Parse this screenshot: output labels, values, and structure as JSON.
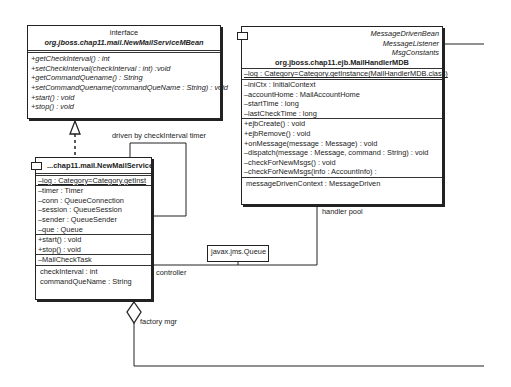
{
  "interface_box": {
    "stereotype": "interface",
    "name": "org.jboss.chap11.mail.NewMailServiceMBean",
    "operations": [
      "+getCheckInterval() : int",
      "+setCheckInterval(checkInterval : int) :void",
      "+getCommandQuename() : String",
      "+setCommandQuename(commandQueName : String) : void",
      "+start() : void",
      "+stop() : void"
    ]
  },
  "mdb_box": {
    "interfaces": [
      "MessageDrivenBean",
      "MessageListener",
      "MsgConstants"
    ],
    "name": "org.jboss.chap11.ejb.MailHandlerMDB",
    "static_attribute": "–log : Category=Category.getInstance(MailHandlerMDB.class)",
    "attributes": [
      "–iniCtx : InitialContext",
      "–accountHome : MailAccountHome",
      "–startTime : long",
      "–lastCheckTime : long"
    ],
    "operations": [
      "+ejbCreate() : void",
      "+ejbRemove() : void",
      "+onMessage(message : Message) : void",
      "–dispatch(message : Message, command : String) : void",
      "–checkForNewMsgs() : void",
      "–checkForNewMsgs(info : AccountInfo) :"
    ],
    "properties": [
      "messageDrivenContext : MessageDriven"
    ]
  },
  "service_box": {
    "name": "...chap11.mail.NewMailService",
    "static_attribute": "–log : Category=Category.getInst",
    "attributes": [
      "–timer : Timer",
      "–conn : QueueConnection",
      "–session : QueueSession",
      "–sender : QueueSender",
      "–que : Queue"
    ],
    "operations": [
      "+start() : void",
      "+stop() : void"
    ],
    "inner_classes": [
      "–MailCheckTask"
    ],
    "properties": [
      "checkInterval : int",
      "commandQueName : String"
    ]
  },
  "queue_box": {
    "name": "javax.jms.Queue"
  },
  "labels": {
    "self_loop": "driven by checkInterval timer",
    "handler_pool": "handler pool",
    "controller": "controller",
    "factory_mgr": "factory mgr"
  }
}
